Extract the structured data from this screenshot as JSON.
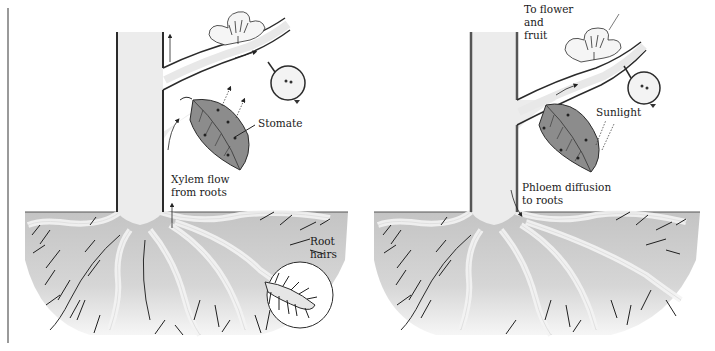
{
  "figure": {
    "panels": [
      {
        "id": "xylem",
        "labels": {
          "stomate": "Stomate",
          "xylem_line1": "Xylem flow",
          "xylem_line2": "from roots",
          "root_hairs_line1": "Root",
          "root_hairs_line2": "hairs"
        }
      },
      {
        "id": "phloem",
        "labels": {
          "flower_line1": "To flower",
          "flower_line2": "and",
          "flower_line3": "fruit",
          "sunlight": "Sunlight",
          "phloem_line1": "Phloem diffusion",
          "phloem_line2": "to roots"
        }
      }
    ]
  },
  "colors": {
    "background": "#ffffff",
    "trunk_fill": "#ebebeb",
    "outline": "#2b2b2b",
    "leaf": "#8c8c8c",
    "soil_top": "#c6c6c6",
    "soil_bottom": "#efefef",
    "root_fill": "#f4f4f4"
  }
}
